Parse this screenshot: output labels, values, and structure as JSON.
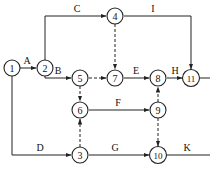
{
  "diagram": {
    "type": "activity-on-arrow network",
    "nodes": [
      {
        "id": "1",
        "x": 12,
        "y": 68
      },
      {
        "id": "2",
        "x": 45,
        "y": 68
      },
      {
        "id": "3",
        "x": 80,
        "y": 155
      },
      {
        "id": "4",
        "x": 115,
        "y": 16
      },
      {
        "id": "5",
        "x": 80,
        "y": 78
      },
      {
        "id": "6",
        "x": 80,
        "y": 110
      },
      {
        "id": "7",
        "x": 115,
        "y": 78
      },
      {
        "id": "8",
        "x": 158,
        "y": 78
      },
      {
        "id": "9",
        "x": 158,
        "y": 110
      },
      {
        "id": "10",
        "x": 158,
        "y": 155
      },
      {
        "id": "11",
        "x": 191,
        "y": 78
      }
    ],
    "activities": [
      {
        "label": "A",
        "from": "1",
        "to": "2",
        "dummy": false
      },
      {
        "label": "B",
        "from": "2",
        "to": "5",
        "dummy": false
      },
      {
        "label": "C",
        "from": "2",
        "to": "4",
        "dummy": false
      },
      {
        "label": "D",
        "from": "1",
        "to": "3",
        "dummy": false
      },
      {
        "label": "E",
        "from": "7",
        "to": "8",
        "dummy": false
      },
      {
        "label": "F",
        "from": "6",
        "to": "9",
        "dummy": false
      },
      {
        "label": "G",
        "from": "3",
        "to": "10",
        "dummy": false
      },
      {
        "label": "H",
        "from": "8",
        "to": "11",
        "dummy": false
      },
      {
        "label": "I",
        "from": "4",
        "to": "11",
        "dummy": false
      },
      {
        "label": "K",
        "from": "10",
        "to": "end",
        "dummy": false
      },
      {
        "label": "",
        "from": "4",
        "to": "7",
        "dummy": true
      },
      {
        "label": "",
        "from": "5",
        "to": "7",
        "dummy": true
      },
      {
        "label": "",
        "from": "5",
        "to": "6",
        "dummy": true
      },
      {
        "label": "",
        "from": "3",
        "to": "6",
        "dummy": true
      },
      {
        "label": "",
        "from": "9",
        "to": "8",
        "dummy": true
      },
      {
        "label": "",
        "from": "9",
        "to": "10",
        "dummy": true
      }
    ]
  },
  "labels": {
    "A": "A",
    "B": "B",
    "C": "C",
    "D": "D",
    "E": "E",
    "F": "F",
    "G": "G",
    "H": "H",
    "I": "I",
    "K": "K"
  },
  "node_labels": {
    "n1": "1",
    "n2": "2",
    "n3": "3",
    "n4": "4",
    "n5": "5",
    "n6": "6",
    "n7": "7",
    "n8": "8",
    "n9": "9",
    "n10": "10",
    "n11": "11"
  }
}
